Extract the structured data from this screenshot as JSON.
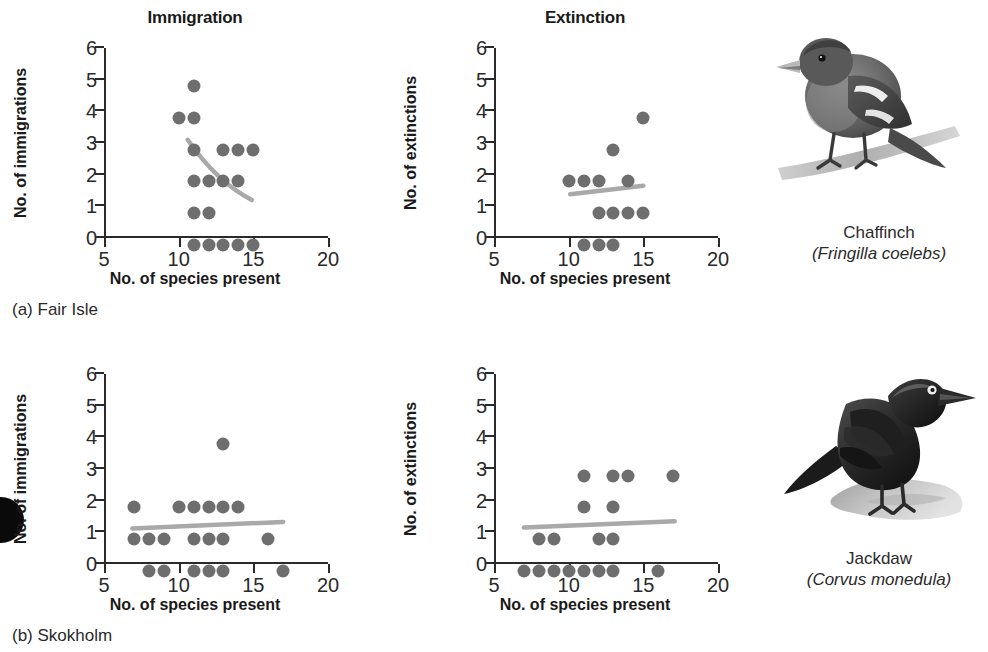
{
  "figure": {
    "column_titles": [
      "Immigration",
      "Extinction"
    ],
    "axis": {
      "x_label": "No. of species present",
      "x_ticks": [
        5,
        10,
        15,
        20
      ],
      "x_min": 5,
      "x_max": 20,
      "y_ticks": [
        0,
        1,
        2,
        3,
        4,
        5,
        6
      ],
      "y_min": 0,
      "y_max": 6,
      "y_label_immigration": "No. of immigrations",
      "y_label_extinction": "No. of extinctions"
    },
    "colors": {
      "point": "#6e6e6e",
      "trend_line": "#a9a9a9",
      "axis": "#2a2a2a",
      "text": "#1a1a1a",
      "background": "#ffffff"
    },
    "panels": [
      {
        "caption": "(a) Fair Isle",
        "bird": {
          "common_name": "Chaffinch",
          "scientific_name": "(Fringilla coelebs)"
        }
      },
      {
        "caption": "(b) Skokholm",
        "bird": {
          "common_name": "Jackdaw",
          "scientific_name": "(Corvus monedula)"
        }
      }
    ]
  },
  "chart_data": [
    {
      "type": "scatter",
      "title": "Immigration",
      "panel": "(a) Fair Isle",
      "xlabel": "No. of species present",
      "ylabel": "No. of immigrations",
      "xlim": [
        5,
        20
      ],
      "ylim": [
        0,
        6
      ],
      "xticks": [
        5,
        10,
        15,
        20
      ],
      "yticks": [
        0,
        1,
        2,
        3,
        4,
        5,
        6
      ],
      "grid": false,
      "legend": "none",
      "points": [
        {
          "x": 11,
          "y": 5
        },
        {
          "x": 10,
          "y": 4
        },
        {
          "x": 11,
          "y": 4
        },
        {
          "x": 11,
          "y": 3
        },
        {
          "x": 13,
          "y": 3
        },
        {
          "x": 14,
          "y": 3
        },
        {
          "x": 15,
          "y": 3
        },
        {
          "x": 11,
          "y": 2
        },
        {
          "x": 12,
          "y": 2
        },
        {
          "x": 13,
          "y": 2
        },
        {
          "x": 14,
          "y": 2
        },
        {
          "x": 11,
          "y": 1
        },
        {
          "x": 12,
          "y": 1
        },
        {
          "x": 11,
          "y": 0
        },
        {
          "x": 12,
          "y": 0
        },
        {
          "x": 13,
          "y": 0
        },
        {
          "x": 14,
          "y": 0
        },
        {
          "x": 15,
          "y": 0
        }
      ],
      "trend": {
        "shape": "curve-decreasing",
        "start": {
          "x": 10.6,
          "y": 3.1
        },
        "control": {
          "x": 12.6,
          "y": 1.75
        },
        "end": {
          "x": 14.9,
          "y": 1.2
        }
      }
    },
    {
      "type": "scatter",
      "title": "Extinction",
      "panel": "(a) Fair Isle",
      "xlabel": "No. of species present",
      "ylabel": "No. of extinctions",
      "xlim": [
        5,
        20
      ],
      "ylim": [
        0,
        6
      ],
      "xticks": [
        5,
        10,
        15,
        20
      ],
      "yticks": [
        0,
        1,
        2,
        3,
        4,
        5,
        6
      ],
      "grid": false,
      "legend": "none",
      "points": [
        {
          "x": 15,
          "y": 4
        },
        {
          "x": 13,
          "y": 3
        },
        {
          "x": 10,
          "y": 2
        },
        {
          "x": 11,
          "y": 2
        },
        {
          "x": 12,
          "y": 2
        },
        {
          "x": 14,
          "y": 2
        },
        {
          "x": 12,
          "y": 1
        },
        {
          "x": 13,
          "y": 1
        },
        {
          "x": 14,
          "y": 1
        },
        {
          "x": 15,
          "y": 1
        },
        {
          "x": 11,
          "y": 0
        },
        {
          "x": 12,
          "y": 0
        },
        {
          "x": 13,
          "y": 0
        }
      ],
      "trend": {
        "shape": "line-increasing",
        "start": {
          "x": 10.1,
          "y": 1.38
        },
        "end": {
          "x": 15.0,
          "y": 1.65
        }
      }
    },
    {
      "type": "scatter",
      "title": "Immigration",
      "panel": "(b) Skokholm",
      "xlabel": "No. of species present",
      "ylabel": "No. of immigrations",
      "xlim": [
        5,
        20
      ],
      "ylim": [
        0,
        6
      ],
      "xticks": [
        5,
        10,
        15,
        20
      ],
      "yticks": [
        0,
        1,
        2,
        3,
        4,
        5,
        6
      ],
      "grid": false,
      "legend": "none",
      "points": [
        {
          "x": 13,
          "y": 4
        },
        {
          "x": 7,
          "y": 2
        },
        {
          "x": 10,
          "y": 2
        },
        {
          "x": 11,
          "y": 2
        },
        {
          "x": 12,
          "y": 2
        },
        {
          "x": 13,
          "y": 2
        },
        {
          "x": 14,
          "y": 2
        },
        {
          "x": 7,
          "y": 1
        },
        {
          "x": 8,
          "y": 1
        },
        {
          "x": 9,
          "y": 1
        },
        {
          "x": 11,
          "y": 1
        },
        {
          "x": 12,
          "y": 1
        },
        {
          "x": 13,
          "y": 1
        },
        {
          "x": 16,
          "y": 1
        },
        {
          "x": 8,
          "y": 0
        },
        {
          "x": 9,
          "y": 0
        },
        {
          "x": 11,
          "y": 0
        },
        {
          "x": 12,
          "y": 0
        },
        {
          "x": 13,
          "y": 0
        },
        {
          "x": 17,
          "y": 0
        }
      ],
      "trend": {
        "shape": "line-increasing",
        "start": {
          "x": 6.9,
          "y": 1.12
        },
        "end": {
          "x": 17.0,
          "y": 1.33
        }
      }
    },
    {
      "type": "scatter",
      "title": "Extinction",
      "panel": "(b) Skokholm",
      "xlabel": "No. of species present",
      "ylabel": "No. of extinctions",
      "xlim": [
        5,
        20
      ],
      "ylim": [
        0,
        6
      ],
      "xticks": [
        5,
        10,
        15,
        20
      ],
      "yticks": [
        0,
        1,
        2,
        3,
        4,
        5,
        6
      ],
      "grid": false,
      "legend": "none",
      "points": [
        {
          "x": 11,
          "y": 3
        },
        {
          "x": 13,
          "y": 3
        },
        {
          "x": 14,
          "y": 3
        },
        {
          "x": 17,
          "y": 3
        },
        {
          "x": 11,
          "y": 2
        },
        {
          "x": 13,
          "y": 2
        },
        {
          "x": 8,
          "y": 1
        },
        {
          "x": 9,
          "y": 1
        },
        {
          "x": 12,
          "y": 1
        },
        {
          "x": 13,
          "y": 1
        },
        {
          "x": 7,
          "y": 0
        },
        {
          "x": 8,
          "y": 0
        },
        {
          "x": 9,
          "y": 0
        },
        {
          "x": 10,
          "y": 0
        },
        {
          "x": 11,
          "y": 0
        },
        {
          "x": 12,
          "y": 0
        },
        {
          "x": 13,
          "y": 0
        },
        {
          "x": 16,
          "y": 0
        }
      ],
      "trend": {
        "shape": "line-increasing",
        "start": {
          "x": 7.0,
          "y": 1.15
        },
        "end": {
          "x": 17.1,
          "y": 1.35
        }
      }
    }
  ]
}
